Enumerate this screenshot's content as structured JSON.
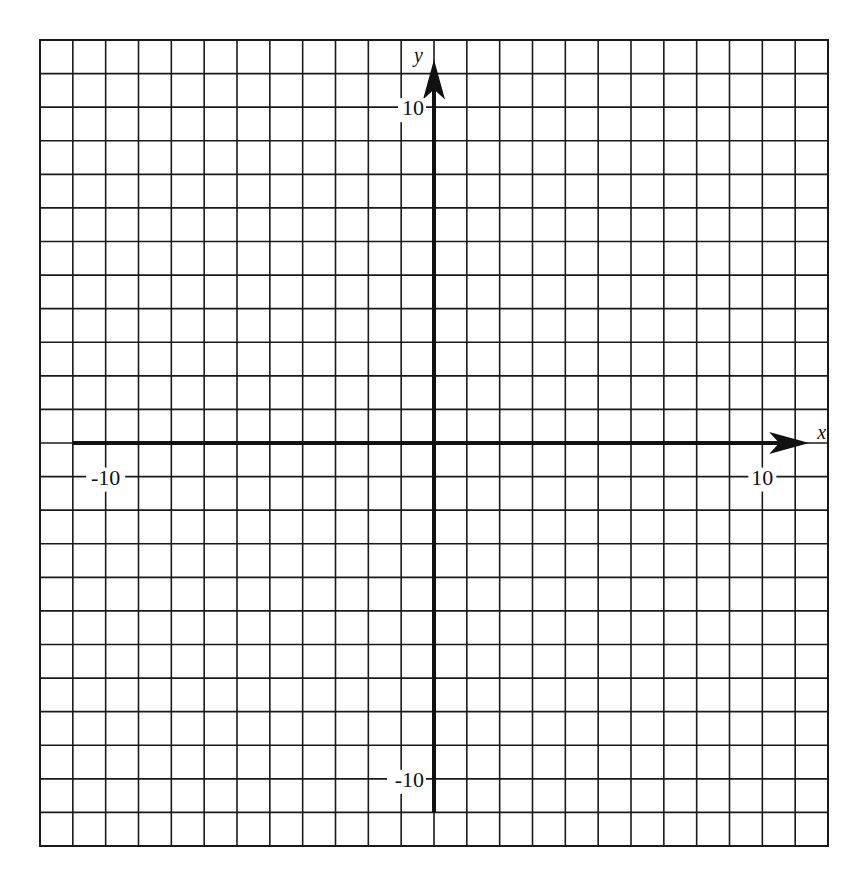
{
  "chart_data": {
    "type": "scatter",
    "title": "",
    "xlabel": "x",
    "ylabel": "y",
    "xlim": [
      -12,
      12
    ],
    "ylim": [
      -12,
      12
    ],
    "grid": true,
    "grid_step": 1,
    "axis_extent": [
      -11,
      11
    ],
    "x_ticks": [
      {
        "value": -10,
        "label": "-10"
      },
      {
        "value": 10,
        "label": "10"
      }
    ],
    "y_ticks": [
      {
        "value": 10,
        "label": "10"
      },
      {
        "value": -10,
        "label": "-10"
      }
    ],
    "series": [],
    "colors": {
      "grid": "#1a1a1a",
      "axis": "#111111",
      "background": "#ffffff"
    }
  }
}
